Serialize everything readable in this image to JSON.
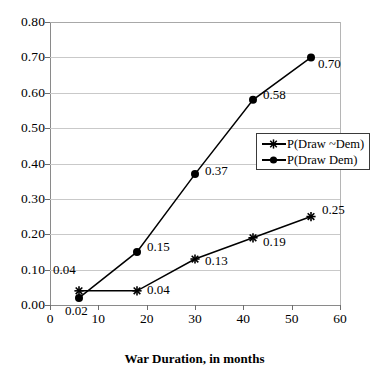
{
  "chart_data": {
    "type": "line",
    "title": "",
    "xlabel": "War Duration, in months",
    "ylabel": "",
    "xlim": [
      0,
      60
    ],
    "ylim": [
      0.0,
      0.8
    ],
    "xticks": [
      "0",
      "10",
      "20",
      "30",
      "40",
      "50",
      "60"
    ],
    "xtick_values": [
      0,
      10,
      20,
      30,
      40,
      50,
      60
    ],
    "yticks": [
      "0.00",
      "0.10",
      "0.20",
      "0.30",
      "0.40",
      "0.50",
      "0.60",
      "0.70",
      "0.80"
    ],
    "ytick_values": [
      0.0,
      0.1,
      0.2,
      0.3,
      0.4,
      0.5,
      0.6,
      0.7,
      0.8
    ],
    "grid": "horizontal",
    "legend_position": "right-middle",
    "x": [
      6,
      18,
      30,
      42,
      54
    ],
    "series": [
      {
        "name": "P(Draw ~Dem)",
        "marker": "star",
        "color": "#000000",
        "values": [
          0.04,
          0.04,
          0.13,
          0.19,
          0.25
        ],
        "point_labels": [
          "0.04",
          "0.04",
          "0.13",
          "0.19",
          "0.25"
        ]
      },
      {
        "name": "P(Draw  Dem)",
        "marker": "circle",
        "color": "#000000",
        "values": [
          0.02,
          0.15,
          0.37,
          0.58,
          0.7
        ],
        "point_labels": [
          "0.02",
          "0.15",
          "0.37",
          "0.58",
          "0.70"
        ]
      }
    ]
  },
  "legend": {
    "entries": [
      {
        "label": "P(Draw ~Dem)"
      },
      {
        "label": "P(Draw  Dem)"
      }
    ]
  },
  "axes": {
    "x_title": "War Duration, in months"
  }
}
